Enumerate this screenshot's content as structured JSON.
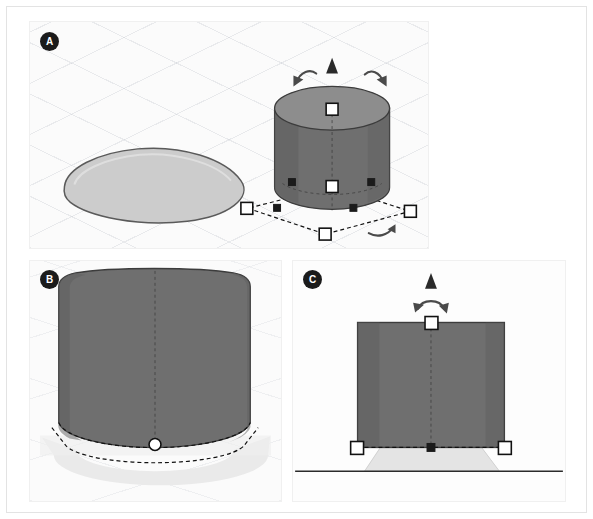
{
  "figure": {
    "caption_badges": [
      "A",
      "B",
      "C"
    ],
    "background_color": "#ffffff",
    "frame_border_color": "#e3e3e3"
  },
  "panels": [
    {
      "id": "panel-a",
      "label": "A",
      "view": "isometric 3D viewport",
      "grid": "isometric ground grid",
      "objects": [
        {
          "name": "egg-outline-shape",
          "kind": "flat teardrop / egg outline on ground plane",
          "fill": "#cfcfcf",
          "stroke": "#4d4d4d"
        },
        {
          "name": "cylinder-solid",
          "kind": "3D cylinder",
          "body_fill": "#6f6f6f",
          "cap_fill": "#8e8e8e",
          "stroke": "#3a3a3a"
        }
      ],
      "gizmos": {
        "up-arrow-glyph": "triangle",
        "rotation-arrows": 3,
        "white-square-handles": 5,
        "black-square-handles": 4,
        "bounding-box": "dashed quadrilateral"
      }
    },
    {
      "id": "panel-b",
      "label": "B",
      "view": "close-up perspective of cylinder base",
      "grid": "faint ground grid",
      "objects": [
        {
          "name": "cylinder-solid",
          "kind": "3D cylinder (zoomed)",
          "body_fill": "#6f6f6f",
          "stroke": "#3a3a3a"
        },
        {
          "name": "ground-shadow-plane",
          "kind": "light ground footprint",
          "fill": "#e8e8e8"
        }
      ],
      "gizmos": {
        "white-circle-handle": 1,
        "dashed-base-ellipse": true,
        "vertical-centerline": true
      }
    },
    {
      "id": "panel-c",
      "label": "C",
      "view": "orthographic front elevation",
      "grid": "none",
      "objects": [
        {
          "name": "cylinder-front-face",
          "kind": "cylinder seen front-on (rectangle)",
          "fill": "#6f6f6f",
          "stroke": "#3a3a3a"
        },
        {
          "name": "egg-shape-edge-on",
          "kind": "light trapezoid footprint",
          "fill": "#e3e3e3"
        },
        {
          "name": "ground-horizon-line",
          "kind": "horizontal ground line",
          "stroke": "#2b2b2b"
        }
      ],
      "gizmos": {
        "up-arrow-glyph": "triangle",
        "rotation-arrows": 1,
        "white-square-handles": 3,
        "black-square-handles": 1,
        "vertical-centerline": true
      }
    }
  ]
}
